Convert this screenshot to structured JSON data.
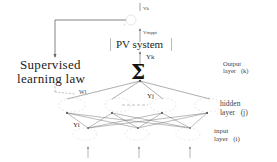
{
  "diagram": {
    "top_signal": "Vk",
    "summing_sign": "+",
    "vmppt_label": "Vmppt",
    "pv_system_label": "PV system",
    "yk_label": "Yk",
    "sigma_symbol": "Σ",
    "learning_block": {
      "line1": "Supervised",
      "line2": "learning law"
    },
    "weight_label": "Wl",
    "hidden_output_label": "Yj",
    "input_output_label": "Yi",
    "layers": {
      "output": {
        "line1": "Output",
        "line2": "layer",
        "index": "(k)"
      },
      "hidden": {
        "line1": "hidden",
        "line2": "layer",
        "index": "(j)"
      },
      "input": {
        "line1": "input",
        "line2": "layer",
        "index": "(i)"
      }
    },
    "colors": {
      "line": "#555555",
      "text": "#222222",
      "background": "#ffffff"
    }
  }
}
